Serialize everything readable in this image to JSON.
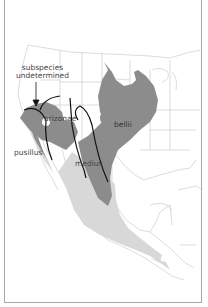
{
  "map": {
    "subject": "Bell's Vireo subspecies range",
    "colors": {
      "breeding": "#8c8c8c",
      "wintering": "#d8d8d8",
      "borders": "#b9b9b9",
      "subspecies_lines": "#111111",
      "frame": "#a8a8a8"
    },
    "labels": {
      "undetermined": [
        "subspecies",
        "undetermined"
      ],
      "arizonae": "arizonae",
      "bellii": "bellii",
      "pusillus": "pusillus",
      "medius": "medius"
    }
  }
}
